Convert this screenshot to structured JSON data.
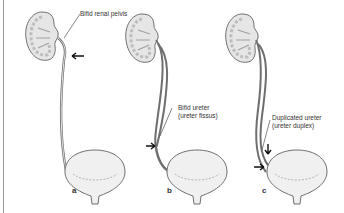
{
  "figure": {
    "type": "anatomical-illustration",
    "panels": [
      {
        "letter": "a",
        "label_line1": "Bifid renal pelvis",
        "label_line2": ""
      },
      {
        "letter": "b",
        "label_line1": "Bifid ureter",
        "label_line2": "(ureter fissus)"
      },
      {
        "letter": "c",
        "label_line1": "Duplicated ureter",
        "label_line2": "(ureter duplex)"
      }
    ]
  },
  "colors": {
    "outline": "#6f6f6f",
    "kidney_fill": "#e6e6e6",
    "bladder_fill": "#f0f0f0",
    "arrow": "#111111",
    "text": "#333333"
  }
}
